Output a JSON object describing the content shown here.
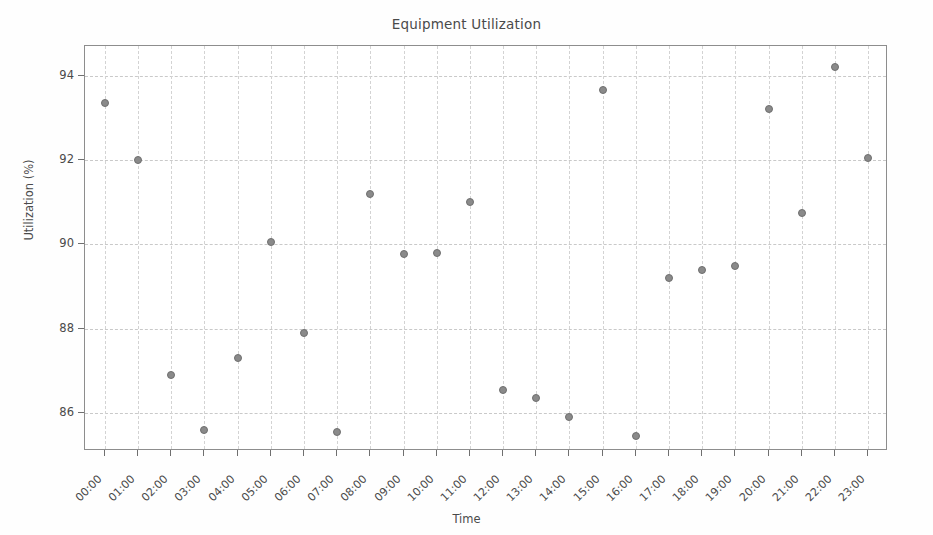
{
  "chart_data": {
    "type": "scatter",
    "title": "Equipment Utilization",
    "xlabel": "Time",
    "ylabel": "Utilization (%)",
    "grid": true,
    "legend": null,
    "xlim": [
      -0.6,
      23.6
    ],
    "ylim": [
      85.1,
      94.7
    ],
    "yticks": [
      86,
      88,
      90,
      92,
      94
    ],
    "ytick_labels": [
      "86",
      "88",
      "90",
      "92",
      "94"
    ],
    "categories": [
      "00:00",
      "01:00",
      "02:00",
      "03:00",
      "04:00",
      "05:00",
      "06:00",
      "07:00",
      "08:00",
      "09:00",
      "10:00",
      "11:00",
      "12:00",
      "13:00",
      "14:00",
      "15:00",
      "16:00",
      "17:00",
      "18:00",
      "19:00",
      "20:00",
      "21:00",
      "22:00",
      "23:00"
    ],
    "values": [
      93.35,
      92.0,
      86.9,
      85.6,
      87.3,
      90.05,
      87.9,
      85.55,
      91.2,
      89.77,
      89.8,
      91.0,
      86.55,
      86.35,
      85.9,
      93.65,
      85.45,
      89.2,
      89.4,
      89.48,
      93.2,
      90.75,
      94.2,
      92.05
    ],
    "marker_color": "#8a8a8a",
    "marker_edge_color": "#6f6f6f"
  }
}
